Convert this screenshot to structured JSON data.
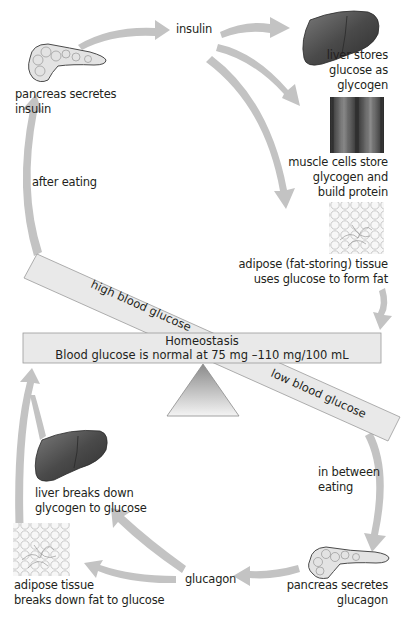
{
  "colors": {
    "arrow": "#c3c3c3",
    "bar_fill": "#e9e9e9",
    "bar_stroke": "#9a9a9a",
    "organ_dark": "#4a4a4a",
    "text": "#231f20"
  },
  "icons": {
    "pancreas_top": "pancreas-icon",
    "liver_top": "liver-icon",
    "muscle": "muscle-fiber-icon",
    "adipose_top": "adipose-tissue-icon",
    "liver_bottom": "liver-icon",
    "adipose_bottom": "adipose-tissue-icon",
    "pancreas_bottom": "pancreas-icon",
    "fulcrum": "triangle-fulcrum-icon"
  },
  "labels": {
    "pancreas_insulin": [
      "pancreas secretes",
      "insulin"
    ],
    "insulin": "insulin",
    "liver_stores": [
      "liver stores",
      "glucose as",
      "glycogen"
    ],
    "muscle": [
      "muscle cells store",
      "glycogen and",
      "build protein"
    ],
    "adipose_form": [
      "adipose (fat-storing) tissue",
      "uses glucose to form fat"
    ],
    "after_eating": "after eating",
    "high_glucose": "high blood glucose",
    "low_glucose": "low blood glucose",
    "homeostasis_title": "Homeostasis",
    "homeostasis_desc": "Blood glucose is normal at 75 mg –110 mg/100 mL",
    "in_between": [
      "in between",
      "eating"
    ],
    "liver_breaks": [
      "liver breaks down",
      "glycogen to glucose"
    ],
    "adipose_breaks": [
      "adipose tissue",
      "breaks down fat to glucose"
    ],
    "glucagon": "glucagon",
    "pancreas_glucagon": [
      "pancreas secretes",
      "glucagon"
    ]
  }
}
